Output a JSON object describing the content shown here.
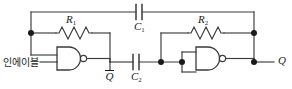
{
  "diagram": {
    "type": "schematic",
    "stroke_color": "#3a3a3a",
    "label_color": "#1a1a1a",
    "background": "#ffffff",
    "width": 292,
    "height": 89
  },
  "labels": {
    "enable_input": "인에이블",
    "r1": "R",
    "r1_sub": "1",
    "r2": "R",
    "r2_sub": "2",
    "c1": "C",
    "c1_sub": "1",
    "c2": "C",
    "c2_sub": "2",
    "q_bar": "Q",
    "q_out": "Q"
  },
  "components": [
    {
      "id": "r1",
      "type": "resistor",
      "label": "R1"
    },
    {
      "id": "r2",
      "type": "resistor",
      "label": "R2"
    },
    {
      "id": "c1",
      "type": "capacitor",
      "label": "C1"
    },
    {
      "id": "c2",
      "type": "capacitor",
      "label": "C2"
    },
    {
      "id": "gate1",
      "type": "nand-gate",
      "inputs": 2
    },
    {
      "id": "gate2",
      "type": "nand-gate",
      "inputs": 2
    }
  ],
  "nodes": [
    {
      "id": "n-left",
      "x": 31,
      "y": 33
    },
    {
      "id": "n-c2-right",
      "x": 161,
      "y": 62
    },
    {
      "id": "n-gate2-in",
      "x": 182,
      "y": 62
    },
    {
      "id": "n-right-top",
      "x": 254,
      "y": 33
    },
    {
      "id": "n-right-out",
      "x": 254,
      "y": 62
    }
  ]
}
